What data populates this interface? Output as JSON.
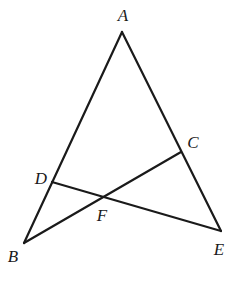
{
  "figure": {
    "type": "geometry-diagram",
    "points": {
      "A": {
        "label": "A",
        "x": 122,
        "y": 32,
        "label_x": 123,
        "label_y": 15
      },
      "B": {
        "label": "B",
        "x": 24,
        "y": 243,
        "label_x": 13,
        "label_y": 256
      },
      "C": {
        "label": "C",
        "x": 181,
        "y": 152,
        "label_x": 193,
        "label_y": 142
      },
      "D": {
        "label": "D",
        "x": 52,
        "y": 182,
        "label_x": 41,
        "label_y": 178
      },
      "E": {
        "label": "E",
        "x": 221,
        "y": 231,
        "label_x": 219,
        "label_y": 249
      },
      "F": {
        "label": "F",
        "x": 104,
        "y": 197,
        "label_x": 102,
        "label_y": 215
      }
    },
    "segments": [
      {
        "from": "A",
        "to": "B"
      },
      {
        "from": "A",
        "to": "E"
      },
      {
        "from": "B",
        "to": "C"
      },
      {
        "from": "D",
        "to": "E"
      }
    ],
    "stroke_color": "#1a1a1a",
    "background_color": "#ffffff"
  },
  "labels": {
    "A": "A",
    "B": "B",
    "C": "C",
    "D": "D",
    "E": "E",
    "F": "F"
  }
}
